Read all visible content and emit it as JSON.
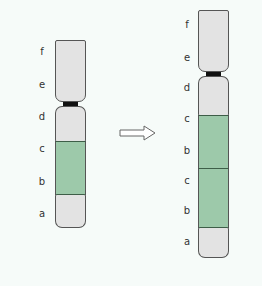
{
  "diagram": {
    "left_chromosome": {
      "labels": [
        "f",
        "e",
        "d",
        "c",
        "b",
        "a"
      ],
      "segments": [
        "f-e arm",
        "d",
        "c-b green",
        "a"
      ]
    },
    "right_chromosome": {
      "labels": [
        "f",
        "e",
        "d",
        "c",
        "b",
        "c",
        "b",
        "a"
      ]
    },
    "arrow": "right-arrow",
    "colors": {
      "band_grey": "#e3e3e3",
      "band_green": "#9dc9aa",
      "centromere": "#111111"
    }
  }
}
